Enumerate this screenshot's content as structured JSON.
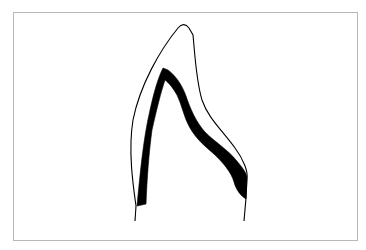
{
  "figure": {
    "type": "tooth-cross-section-diagram",
    "colors": {
      "frame_border": "#b8b8b8",
      "outline": "#000000",
      "band_fill": "#000000",
      "background": "#ffffff"
    },
    "shapes": {
      "outer_outline": "M136,206 C133,185 128,150 133,120 C140,85 160,50 178,28 C182,23 186,24 189,28 L193,35 C195,55 196,80 202,100 C208,118 222,130 235,148 C244,160 248,172 247,178 L246,198",
      "left_stem": "M136,206 L135,221",
      "right_stem": "M246,198 L244,221",
      "inner_band": "M137,206 C140,175 143,140 150,110 C154,92 158,78 163,68 L168,70 C176,76 182,85 186,96 C190,108 196,122 205,132 C215,142 228,150 236,160 C242,167 246,172 247,177 L246,199 C241,196 236,190 234,182 C231,172 224,164 215,155 C205,146 197,140 190,128 C184,118 182,105 177,95 C173,88 169,83 165,80 C161,92 157,108 152,130 C149,152 147,178 146,204 Z"
    }
  }
}
